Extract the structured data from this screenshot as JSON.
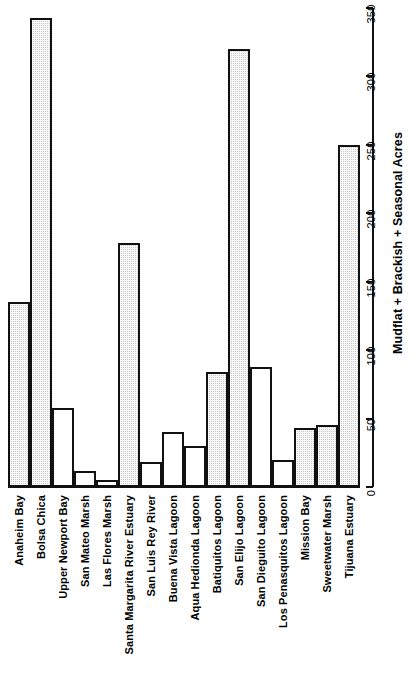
{
  "chart_data": {
    "type": "bar",
    "title": "",
    "subtitle": "",
    "xlabel": "",
    "ylabel": "Mudflat + Brackish + Seasonal Acres",
    "ylim": [
      0,
      350
    ],
    "yticks": [
      0,
      50,
      100,
      150,
      200,
      250,
      300,
      350
    ],
    "ytick_labels": [
      "0",
      "50",
      "100",
      "150",
      "200",
      "250",
      "300",
      "350"
    ],
    "grid": false,
    "legend": "none",
    "orientation": "vertical-bars-rotated-page",
    "categories": [
      "Anaheim Bay",
      "Bolsa Chica",
      "Upper Newport Bay",
      "San Mateo Marsh",
      "Las Flores Marsh",
      "Santa Margarita River Estuary",
      "San Luis Rey River",
      "Buena Vista Lagoon",
      "Aqua Hedionda Lagoon",
      "Batiquitos Lagoon",
      "San Elijo Lagoon",
      "San Dieguito Lagoon",
      "Los Penasquitos Lagoon",
      "Mission Bay",
      "Sweetwater Marsh",
      "Tijuana Estuary"
    ],
    "values": [
      135,
      343,
      58,
      12,
      5,
      178,
      18,
      40,
      30,
      84,
      320,
      88,
      20,
      43,
      45,
      250
    ],
    "bar_styles": [
      "filled",
      "filled",
      "open",
      "open",
      "open",
      "filled",
      "open",
      "open",
      "open",
      "filled",
      "filled",
      "open",
      "open",
      "filled",
      "filled",
      "filled"
    ]
  },
  "axis": {
    "value_axis_title": "Mudflat + Brackish + Seasonal Acres"
  },
  "colors": {
    "bar_fill": "#c9c9c9",
    "bar_outline": "#111111",
    "background": "#ffffff",
    "text": "#000000"
  }
}
